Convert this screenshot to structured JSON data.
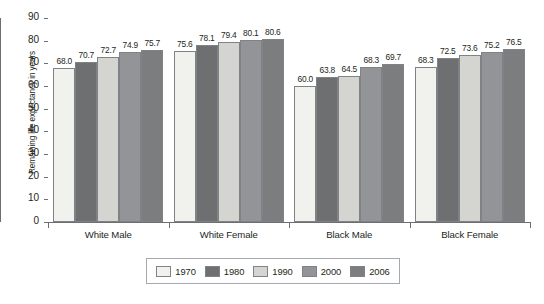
{
  "chart_data": {
    "type": "bar",
    "title": "",
    "subtitle": "",
    "xlabel": "",
    "ylabel": "Remaining life expectancy in years",
    "ylim": [
      0,
      90
    ],
    "y_ticks": [
      0,
      10,
      20,
      30,
      40,
      50,
      60,
      70,
      80,
      90
    ],
    "grid": false,
    "legend_position": "bottom",
    "categories": [
      "White Male",
      "White Female",
      "Black Male",
      "Black Female"
    ],
    "series": [
      {
        "name": "1970",
        "color": "#f1f1ee",
        "values": [
          68.0,
          75.6,
          60.0,
          68.3
        ],
        "labels": [
          "68.0",
          "75.6",
          "60.0",
          "68.3"
        ]
      },
      {
        "name": "1980",
        "color": "#6e6f71",
        "values": [
          70.7,
          78.1,
          63.8,
          72.5
        ],
        "labels": [
          "70.7",
          "78.1",
          "63.8",
          "72.5"
        ]
      },
      {
        "name": "1990",
        "color": "#d4d4d1",
        "values": [
          72.7,
          79.4,
          64.5,
          73.6
        ],
        "labels": [
          "72.7",
          "79.4",
          "64.5",
          "73.6"
        ]
      },
      {
        "name": "2000",
        "color": "#929497",
        "values": [
          74.9,
          80.1,
          68.3,
          75.2
        ],
        "labels": [
          "74.9",
          "80.1",
          "68.3",
          "75.2"
        ]
      },
      {
        "name": "2006",
        "color": "#7b7d7f",
        "values": [
          75.7,
          80.6,
          69.7,
          76.5
        ],
        "labels": [
          "75.7",
          "80.6",
          "69.7",
          "76.5"
        ]
      }
    ]
  },
  "axis": {
    "y_title": "Remaining life expectancy in years",
    "tick_labels": [
      "90",
      "80",
      "70",
      "60",
      "50",
      "40",
      "30",
      "20",
      "10",
      "0"
    ]
  },
  "categories_labels": [
    "White Male",
    "White Female",
    "Black Male",
    "Black Female"
  ],
  "legend": {
    "entries": [
      {
        "label": "1970",
        "color": "#f1f1ee"
      },
      {
        "label": "1980",
        "color": "#6e6f71"
      },
      {
        "label": "1990",
        "color": "#d4d4d1"
      },
      {
        "label": "2000",
        "color": "#929497"
      },
      {
        "label": "2006",
        "color": "#7b7d7f"
      }
    ]
  },
  "colors": {
    "axis": "#6d6e71",
    "text": "#231f20",
    "bar_outline": "#808285",
    "legend_border": "#a7a9ac",
    "background": "#ffffff"
  }
}
